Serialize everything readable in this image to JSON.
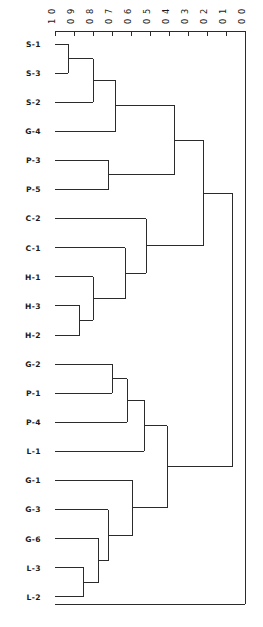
{
  "chart_data": {
    "type": "dendrogram",
    "title": "",
    "xlabel": "",
    "ylabel": "",
    "orientation": "horizontal",
    "axis_position": "top",
    "grid": false,
    "legend": false,
    "xlim": [
      1.0,
      0.0
    ],
    "axis_ticks": [
      "1 0",
      "0 9",
      "0 8",
      "0 7",
      "0 6",
      "0 5",
      "0 4",
      "0 3",
      "0 2",
      "0 1",
      "0 0"
    ],
    "axis_tick_values": [
      1.0,
      0.9,
      0.8,
      0.7,
      0.6,
      0.5,
      0.4,
      0.3,
      0.2,
      0.1,
      0.0
    ],
    "axis_label_rotation": -90,
    "leaves": [
      "S-1",
      "S-3",
      "S-2",
      "G-4",
      "P-3",
      "P-5",
      "C-2",
      "C-1",
      "H-1",
      "H-3",
      "H-2",
      "G-2",
      "P-1",
      "P-4",
      "L-1",
      "G-1",
      "G-3",
      "G-6",
      "L-3",
      "L-2"
    ],
    "leaf_start_value": 1.0,
    "merges": [
      {
        "id": "m1",
        "children": [
          "S-1",
          "S-3"
        ],
        "height": 0.93
      },
      {
        "id": "m2",
        "children": [
          "m1",
          "S-2"
        ],
        "height": 0.8
      },
      {
        "id": "m3",
        "children": [
          "m2",
          "G-4"
        ],
        "height": 0.68
      },
      {
        "id": "m4",
        "children": [
          "P-3",
          "P-5"
        ],
        "height": 0.72
      },
      {
        "id": "m5",
        "children": [
          "m3",
          "m4"
        ],
        "height": 0.37
      },
      {
        "id": "m6",
        "children": [
          "H-3",
          "H-2"
        ],
        "height": 0.87
      },
      {
        "id": "m7",
        "children": [
          "H-1",
          "m6"
        ],
        "height": 0.8
      },
      {
        "id": "m8",
        "children": [
          "C-1",
          "m7"
        ],
        "height": 0.63
      },
      {
        "id": "m9",
        "children": [
          "C-2",
          "m8"
        ],
        "height": 0.52
      },
      {
        "id": "m10",
        "children": [
          "m5",
          "m9"
        ],
        "height": 0.22
      },
      {
        "id": "m11",
        "children": [
          "G-2",
          "P-1"
        ],
        "height": 0.7
      },
      {
        "id": "m12",
        "children": [
          "m11",
          "P-4"
        ],
        "height": 0.62
      },
      {
        "id": "m13",
        "children": [
          "m12",
          "L-1"
        ],
        "height": 0.53
      },
      {
        "id": "m14",
        "children": [
          "L-3",
          "L-2"
        ],
        "height": 0.85
      },
      {
        "id": "m15",
        "children": [
          "m14",
          "G-6"
        ],
        "height": 0.77
      },
      {
        "id": "m16",
        "children": [
          "m15",
          "G-3"
        ],
        "height": 0.72
      },
      {
        "id": "m17",
        "children": [
          "m16",
          "G-1"
        ],
        "height": 0.59
      },
      {
        "id": "m18",
        "children": [
          "m13",
          "m17"
        ],
        "height": 0.41
      },
      {
        "id": "m19",
        "children": [
          "m10",
          "m18"
        ],
        "height": 0.065
      }
    ],
    "line_color": "#2b2b2b",
    "background_color": "#ffffff"
  },
  "layout": {
    "plot_left": 55,
    "plot_right": 245,
    "axis_y": 31,
    "frame_bottom": 604,
    "leaf_top": 44,
    "leaf_spacing": 29.1,
    "tick_length": 5,
    "label_x": 41
  }
}
